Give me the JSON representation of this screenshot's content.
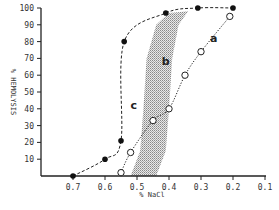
{
  "chart_data": {
    "type": "line",
    "title": "",
    "xlabel": "% NaCl",
    "ylabel": "% HEMOLYSIS",
    "xlim": [
      0.8,
      0.1
    ],
    "ylim": [
      0,
      100
    ],
    "x_reversed": true,
    "x_ticks": [
      "0.7",
      "0.6",
      "0.5",
      "0.4",
      "0.3",
      "0.2",
      "0.1"
    ],
    "y_ticks": [
      "10",
      "20",
      "30",
      "40",
      "50",
      "60",
      "70",
      "80",
      "90",
      "100"
    ],
    "grid": false,
    "legend": "none (curves labeled inline)",
    "series": [
      {
        "name": "c",
        "marker": "filled-circle",
        "line": "dashed",
        "points": [
          {
            "x": 0.7,
            "y": 0
          },
          {
            "x": 0.6,
            "y": 10
          },
          {
            "x": 0.55,
            "y": 21
          },
          {
            "x": 0.54,
            "y": 80
          },
          {
            "x": 0.41,
            "y": 97
          },
          {
            "x": 0.31,
            "y": 100
          },
          {
            "x": 0.2,
            "y": 100
          }
        ]
      },
      {
        "name": "a",
        "marker": "open-circle",
        "line": "dotted",
        "points": [
          {
            "x": 0.55,
            "y": 2
          },
          {
            "x": 0.52,
            "y": 14
          },
          {
            "x": 0.45,
            "y": 33
          },
          {
            "x": 0.4,
            "y": 40
          },
          {
            "x": 0.35,
            "y": 60
          },
          {
            "x": 0.3,
            "y": 74
          },
          {
            "x": 0.21,
            "y": 95
          }
        ]
      },
      {
        "name": "b",
        "type": "shaded-band",
        "description": "stippled normal range band between curves c and a",
        "left_edge": [
          {
            "x": 0.52,
            "y": 0
          },
          {
            "x": 0.49,
            "y": 15
          },
          {
            "x": 0.48,
            "y": 40
          },
          {
            "x": 0.47,
            "y": 70
          },
          {
            "x": 0.44,
            "y": 90
          },
          {
            "x": 0.4,
            "y": 97
          }
        ],
        "right_edge": [
          {
            "x": 0.44,
            "y": 0
          },
          {
            "x": 0.41,
            "y": 15
          },
          {
            "x": 0.4,
            "y": 40
          },
          {
            "x": 0.39,
            "y": 70
          },
          {
            "x": 0.37,
            "y": 90
          },
          {
            "x": 0.34,
            "y": 98
          }
        ]
      }
    ],
    "annotations": [
      {
        "text": "a",
        "x": 0.26,
        "y": 80
      },
      {
        "text": "b",
        "x": 0.41,
        "y": 66
      },
      {
        "text": "c",
        "x": 0.51,
        "y": 40
      }
    ]
  },
  "labels": {
    "xlabel": "% NaCl",
    "ylabel": "% HEMOLYSIS",
    "curve_a": "a",
    "curve_b": "b",
    "curve_c": "c"
  }
}
